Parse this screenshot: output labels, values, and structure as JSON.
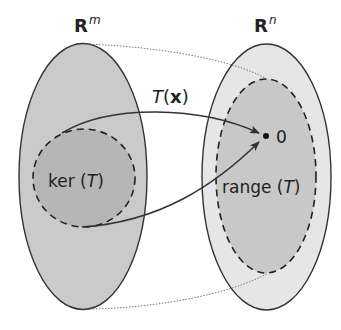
{
  "diagram": {
    "domain_space": {
      "label_base": "R",
      "label_exp": "m"
    },
    "codomain_space": {
      "label_base": "R",
      "label_exp": "n"
    },
    "kernel": {
      "label_pre": "ker (",
      "label_var": "T",
      "label_post": ")"
    },
    "range": {
      "label_pre": "range (",
      "label_var": "T",
      "label_post": ")"
    },
    "mapping": {
      "label_func": "T",
      "label_open": "(",
      "label_arg": "x",
      "label_close": ")"
    },
    "zero_vector": {
      "label": "0"
    },
    "colors": {
      "domain_fill": "#cacaca",
      "kernel_fill": "#b6b6b6",
      "codomain_fill": "#e6e6e6",
      "range_fill": "#c8c8c8",
      "stroke": "#333333",
      "dotted": "#777777"
    }
  }
}
